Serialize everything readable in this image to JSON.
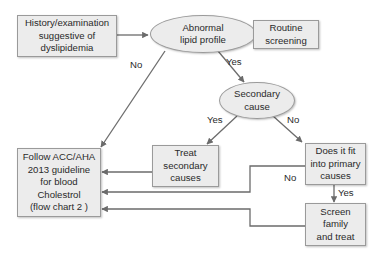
{
  "diagram": {
    "type": "flowchart",
    "colors": {
      "node_fill": "#ececec",
      "node_border": "#9a9a9a",
      "edge": "#6b6b6b",
      "text": "#2a2a2a"
    },
    "nodes": {
      "history": {
        "label": "History/examination\nsuggestive of\ndyslipidemia",
        "shape": "rectangle"
      },
      "abnormal": {
        "label": "Abnormal\nlipid profile",
        "shape": "ellipse"
      },
      "routine": {
        "label": "Routine\nscreening",
        "shape": "rectangle"
      },
      "secondary": {
        "label": "Secondary\ncause",
        "shape": "ellipse"
      },
      "treat": {
        "label": "Treat\nsecondary\ncauses",
        "shape": "rectangle"
      },
      "primary": {
        "label": "Does it fit\ninto primary\ncauses",
        "shape": "rectangle"
      },
      "follow": {
        "label": "Follow ACC/AHA\n2013 guideline\nfor blood\nCholestrol\n(flow chart 2 )",
        "shape": "rectangle"
      },
      "screen": {
        "label": "Screen\nfamily\nand treat",
        "shape": "rectangle"
      }
    },
    "edge_labels": {
      "abnormal_no": "No",
      "abnormal_yes": "Yes",
      "secondary_yes": "Yes",
      "secondary_no": "No",
      "primary_no": "No",
      "primary_yes": "Yes"
    },
    "edges": [
      {
        "from": "history",
        "to": "abnormal",
        "label": ""
      },
      {
        "from": "routine",
        "to": "abnormal",
        "label": ""
      },
      {
        "from": "abnormal",
        "to": "follow",
        "label": "No"
      },
      {
        "from": "abnormal",
        "to": "secondary",
        "label": "Yes"
      },
      {
        "from": "secondary",
        "to": "treat",
        "label": "Yes"
      },
      {
        "from": "secondary",
        "to": "primary",
        "label": "No"
      },
      {
        "from": "treat",
        "to": "follow",
        "label": ""
      },
      {
        "from": "primary",
        "to": "follow",
        "label": "No"
      },
      {
        "from": "primary",
        "to": "screen",
        "label": "Yes"
      },
      {
        "from": "screen",
        "to": "follow",
        "label": ""
      }
    ]
  }
}
